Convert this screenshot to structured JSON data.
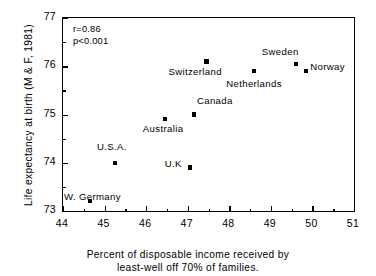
{
  "chart_data": {
    "type": "scatter",
    "title": "",
    "xlabel_lines": [
      "Percent of disposable income received by",
      "least-well off 70% of families."
    ],
    "ylabel": "Life expectancy at birth (M & F, 1981)",
    "xlim": [
      44,
      51
    ],
    "ylim": [
      73,
      77
    ],
    "xticks": [
      44,
      45,
      46,
      47,
      48,
      49,
      50,
      51
    ],
    "yticks": [
      73,
      74,
      75,
      76,
      77
    ],
    "xtick_labels": [
      "44",
      "45",
      "46",
      "47",
      "48",
      "49",
      "50",
      "51"
    ],
    "ytick_labels": [
      "73",
      "74",
      "75",
      "76",
      "77"
    ],
    "xminor_step": 0.5,
    "yminor_step": 0.5,
    "grid": false,
    "legend": "none",
    "marker_color": "#000000",
    "annotations": [
      {
        "name": "correlation",
        "text": "r=0.86"
      },
      {
        "name": "p-value",
        "text": "p<0.001"
      }
    ],
    "points": [
      {
        "label": "W. Germany",
        "x": 44.65,
        "y": 73.2,
        "label_dx": -26,
        "label_dy": -4,
        "label_align": "left"
      },
      {
        "label": "U.S.A.",
        "x": 45.25,
        "y": 74.0,
        "label_dx": -18,
        "label_dy": -16,
        "label_align": "left"
      },
      {
        "label": "Australia",
        "x": 46.45,
        "y": 74.9,
        "label_dx": -22,
        "label_dy": 10,
        "label_align": "left"
      },
      {
        "label": "U.K",
        "x": 47.05,
        "y": 73.9,
        "label_dx": -25,
        "label_dy": -4,
        "label_align": "left"
      },
      {
        "label": "Canada",
        "x": 47.15,
        "y": 75.0,
        "label_dx": 3,
        "label_dy": -14,
        "label_align": "left"
      },
      {
        "label": "Switzerland",
        "x": 47.45,
        "y": 76.1,
        "label_dx": -38,
        "label_dy": 11,
        "label_align": "left"
      },
      {
        "label": "Netherlands",
        "x": 48.6,
        "y": 75.9,
        "label_dx": -28,
        "label_dy": 13,
        "label_align": "left"
      },
      {
        "label": "Sweden",
        "x": 49.6,
        "y": 76.05,
        "label_dx": -34,
        "label_dy": -12,
        "label_align": "left"
      },
      {
        "label": "Norway",
        "x": 49.85,
        "y": 75.9,
        "label_dx": 4,
        "label_dy": -4,
        "label_align": "left"
      }
    ]
  }
}
